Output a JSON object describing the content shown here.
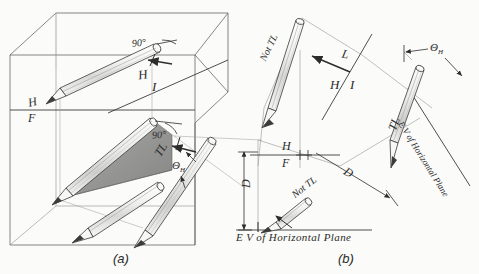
{
  "figure": {
    "ink_color": "#3a3a3a",
    "shade_color": "#9a9a9a",
    "paper_color": "#fbfbf9",
    "captions": [
      {
        "id": "a",
        "text": "(a)"
      },
      {
        "id": "b",
        "text": "(b)"
      }
    ]
  },
  "panel_a": {
    "name": "pictorial-glass-box",
    "labels": {
      "angle_top": "90°",
      "angle_mid": "90°",
      "fold_h": "H",
      "fold_f": "F",
      "fold_h2": "H",
      "fold_i": "I",
      "true_length": "TL",
      "slope_angle_theta": "Θ",
      "slope_angle_sub": "H"
    }
  },
  "panel_b": {
    "name": "orthographic-views",
    "labels": {
      "not_tl_top": "Not TL",
      "line_l": "L",
      "fold_h_top": "H",
      "fold_i_top": "I",
      "true_length": "TL",
      "slope_angle_theta": "Θ",
      "slope_angle_sub": "H",
      "ev_plane_incline": "E V of Horizontal Plane",
      "fold_h_bottom": "H",
      "fold_f_bottom": "F",
      "dim_d_vertical": "D",
      "dim_d_incline": "D",
      "dim_h": "H",
      "not_tl_bottom": "Not TL",
      "ev_plane_bottom": "E V of Horizontal  Plane"
    }
  }
}
